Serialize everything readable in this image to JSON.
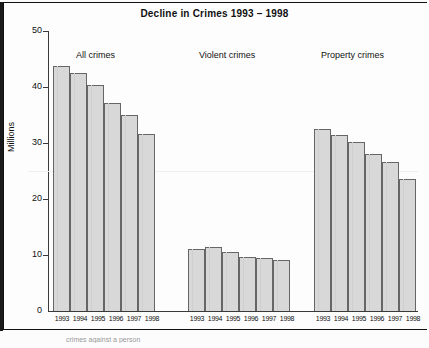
{
  "chart_data": {
    "type": "bar",
    "title": "Decline in Crimes 1993 – 1998",
    "xlabel": "",
    "ylabel": "Millions",
    "ylim": [
      0,
      50
    ],
    "yticks": [
      "0",
      "10",
      "20",
      "30",
      "40",
      "50"
    ],
    "grid": false,
    "legend": "none",
    "categories": [
      "1993",
      "1994",
      "1995",
      "1996",
      "1997",
      "1998"
    ],
    "groups": [
      {
        "name": "All crimes",
        "categories": [
          "1993",
          "1994",
          "1995",
          "1996",
          "1997",
          "1998"
        ],
        "values": [
          43.8,
          42.5,
          40.3,
          37.2,
          35.0,
          31.6
        ]
      },
      {
        "name": "Violent crimes",
        "categories": [
          "1993",
          "1994",
          "1995",
          "1996",
          "1997",
          "1998"
        ],
        "values": [
          11.1,
          11.4,
          10.5,
          9.6,
          9.5,
          9.1
        ]
      },
      {
        "name": "Property crimes",
        "categories": [
          "1993",
          "1994",
          "1995",
          "1996",
          "1997",
          "1998"
        ],
        "values": [
          32.5,
          31.5,
          30.2,
          28.1,
          26.6,
          23.5
        ]
      }
    ],
    "series": [
      {
        "name": "All crimes",
        "values": [
          43.8,
          42.5,
          40.3,
          37.2,
          35.0,
          31.6
        ]
      },
      {
        "name": "Violent crimes",
        "values": [
          11.1,
          11.4,
          10.5,
          9.6,
          9.5,
          9.1
        ]
      },
      {
        "name": "Property crimes",
        "values": [
          32.5,
          31.5,
          30.2,
          28.1,
          26.6,
          23.5
        ]
      }
    ],
    "colors": {
      "bar_fill": "#d8d8d8",
      "bar_border": "#666666",
      "text": "#111111",
      "background": "#fdfdfd"
    }
  },
  "footer": {
    "note": "crimes against a person"
  }
}
